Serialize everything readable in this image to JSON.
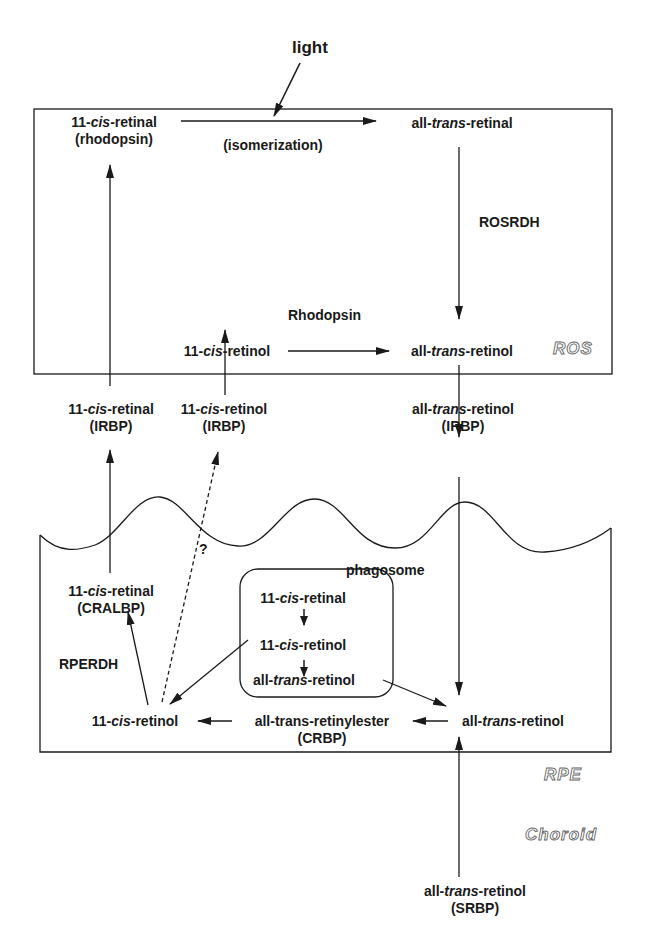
{
  "regions": {
    "ros": "ROS",
    "rpe": "RPE",
    "choroid": "Choroid"
  },
  "stimulus": "light",
  "ros": {
    "cis_retinal_rhodopsin": {
      "pre": "11-",
      "it": "cis",
      "post": "-retinal",
      "sub": "(rhodopsin)"
    },
    "isomerization": "(isomerization)",
    "trans_retinal": {
      "pre": "all-",
      "it": "trans",
      "post": "-retinal"
    },
    "rosrdh": "ROSRDH",
    "rhodopsin": "Rhodopsin",
    "cis_retinol": {
      "pre": "11-",
      "it": "cis",
      "post": "-retinol"
    },
    "trans_retinol": {
      "pre": "all-",
      "it": "trans",
      "post": "-retinol"
    }
  },
  "interphotoreceptor": {
    "cis_retinal_irbp": {
      "pre": "11-",
      "it": "cis",
      "post": "-retinal",
      "sub": "(IRBP)"
    },
    "cis_retinol_irbp": {
      "pre": "11-",
      "it": "cis",
      "post": "-retinol",
      "sub": "(IRBP)"
    },
    "trans_retinol_irbp": {
      "pre": "all-",
      "it": "trans",
      "post": "-retinol",
      "sub": "(IRBP)"
    },
    "question": "?"
  },
  "rpe": {
    "phagosome": "phagosome",
    "cis_retinal_cralbp": {
      "pre": "11-",
      "it": "cis",
      "post": "-retinal",
      "sub": "(CRALBP)"
    },
    "phagosome_box": [
      {
        "pre": "11-",
        "it": "cis",
        "post": "-retinal"
      },
      {
        "pre": "11-",
        "it": "cis",
        "post": "-retinol"
      },
      {
        "pre": "all-",
        "it": "trans",
        "post": "-retinol"
      }
    ],
    "rperdh": "RPERDH",
    "cis_retinol": {
      "pre": "11-",
      "it": "cis",
      "post": "-retinol"
    },
    "retinylester": {
      "text": "all-trans-retinylester",
      "sub": "(CRBP)"
    },
    "trans_retinol": {
      "pre": "all-",
      "it": "trans",
      "post": "-retinol"
    }
  },
  "choroid": {
    "trans_retinol_srbp": {
      "pre": "all-",
      "it": "trans",
      "post": "-retinol",
      "sub": "(SRBP)"
    }
  }
}
